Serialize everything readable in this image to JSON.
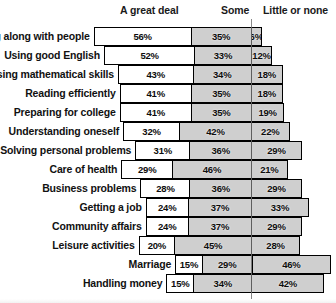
{
  "chart_data": {
    "type": "bar",
    "subtype": "stacked-horizontal-diverging",
    "title": "",
    "xlabel": "",
    "ylabel": "",
    "legend_position": "top",
    "grid": false,
    "value_suffix": "%",
    "series": [
      {
        "name": "A great deal",
        "key": "great"
      },
      {
        "name": "Some",
        "key": "some"
      },
      {
        "name": "Little or none",
        "key": "little"
      }
    ],
    "categories": [
      "Getting along with people",
      "Using good English",
      "Using mathematical skills",
      "Reading efficiently",
      "Preparing for college",
      "Understanding oneself",
      "Solving personal problems",
      "Care of health",
      "Business problems",
      "Getting a job",
      "Community affairs",
      "Leisure activities",
      "Marriage",
      "Handling money"
    ],
    "rows": [
      {
        "label": "Getting along with people",
        "great": 56,
        "some": 35,
        "little": 6,
        "great_text": "56%",
        "some_text": "35%",
        "little_text": "6%"
      },
      {
        "label": "Using good English",
        "great": 52,
        "some": 33,
        "little": 12,
        "great_text": "52%",
        "some_text": "33%",
        "little_text": "12%"
      },
      {
        "label": "Using mathematical skills",
        "great": 43,
        "some": 34,
        "little": 18,
        "great_text": "43%",
        "some_text": "34%",
        "little_text": "18%"
      },
      {
        "label": "Reading efficiently",
        "great": 41,
        "some": 35,
        "little": 18,
        "great_text": "41%",
        "some_text": "35%",
        "little_text": "18%"
      },
      {
        "label": "Preparing for college",
        "great": 41,
        "some": 35,
        "little": 19,
        "great_text": "41%",
        "some_text": "35%",
        "little_text": "19%"
      },
      {
        "label": "Understanding oneself",
        "great": 32,
        "some": 42,
        "little": 22,
        "great_text": "32%",
        "some_text": "42%",
        "little_text": "22%"
      },
      {
        "label": "Solving personal problems",
        "great": 31,
        "some": 36,
        "little": 29,
        "great_text": "31%",
        "some_text": "36%",
        "little_text": "29%"
      },
      {
        "label": "Care of health",
        "great": 29,
        "some": 46,
        "little": 21,
        "great_text": "29%",
        "some_text": "46%",
        "little_text": "21%"
      },
      {
        "label": "Business problems",
        "great": 28,
        "some": 36,
        "little": 29,
        "great_text": "28%",
        "some_text": "36%",
        "little_text": "29%"
      },
      {
        "label": "Getting a job",
        "great": 24,
        "some": 37,
        "little": 33,
        "great_text": "24%",
        "some_text": "37%",
        "little_text": "33%"
      },
      {
        "label": "Community affairs",
        "great": 24,
        "some": 37,
        "little": 29,
        "great_text": "24%",
        "some_text": "37%",
        "little_text": "29%"
      },
      {
        "label": "Leisure activities",
        "great": 20,
        "some": 45,
        "little": 28,
        "great_text": "20%",
        "some_text": "45%",
        "little_text": "28%"
      },
      {
        "label": "Marriage",
        "great": 15,
        "some": 29,
        "little": 46,
        "great_text": "15%",
        "some_text": "29%",
        "little_text": "46%"
      },
      {
        "label": "Handling money",
        "great": 15,
        "some": 34,
        "little": 42,
        "great_text": "15%",
        "some_text": "34%",
        "little_text": "42%"
      }
    ]
  },
  "headers": {
    "great": "A great deal",
    "some": "Some",
    "little": "Little or none"
  },
  "colors": {
    "bar_outline": "#000000",
    "great_fill": "#ffffff",
    "some_fill": "#cfcfcf",
    "little_fill": "#cfcfcf",
    "text": "#111111",
    "background": "#ffffff"
  }
}
